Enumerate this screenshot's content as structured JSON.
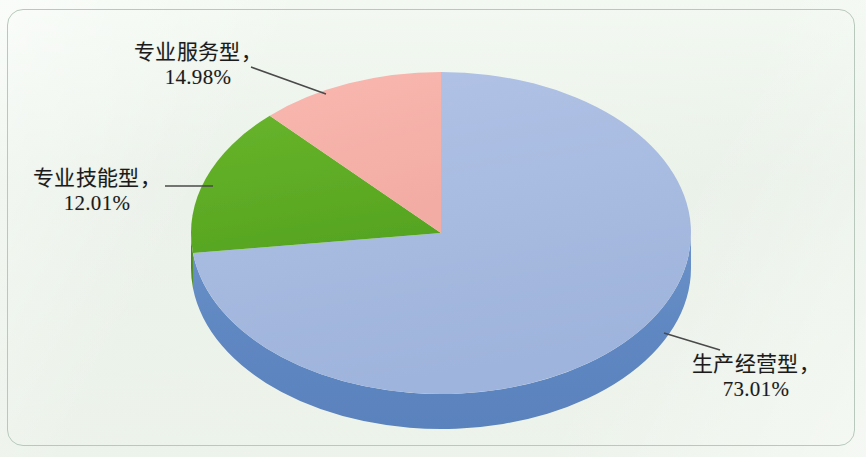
{
  "chart_data": {
    "type": "pie",
    "title": "",
    "subtitle": "",
    "xlabel": "",
    "ylabel": "",
    "three_d": true,
    "legend_position": "none",
    "label_style": "callout-with-leader-line",
    "grid": false,
    "categories": [
      "生产经营型",
      "专业服务型",
      "专业技能型"
    ],
    "values": [
      73.01,
      14.98,
      12.01
    ],
    "units": "%",
    "slices": [
      {
        "name": "生产经营型",
        "value": 73.01,
        "value_text": "73.01%",
        "label_text": "生产经营型，",
        "color": "#aabce1",
        "side_color": "#5f87c1",
        "start_angle_deg": 0,
        "sweep_deg": 262.836
      },
      {
        "name": "专业服务型",
        "value": 14.98,
        "value_text": "14.98%",
        "label_text": "专业服务型，",
        "color": "#5fae26",
        "side_color": "#4a8c1d",
        "start_angle_deg": 262.836,
        "sweep_deg": 53.928
      },
      {
        "name": "专业技能型",
        "value": 12.01,
        "value_text": "12.01%",
        "label_text": "专业技能型，",
        "color": "#f6b2aa",
        "side_color": "#d98a82",
        "start_angle_deg": 316.764,
        "sweep_deg": 43.236
      }
    ]
  },
  "canvas": {
    "background_color": "#eef3ec",
    "border_color": "#b8c9bc",
    "text_color": "#1b1b1b",
    "leader_line_color": "#4a4a4a"
  },
  "labels": {
    "green": {
      "name": "专业服务型，",
      "value": "14.98%"
    },
    "pink": {
      "name": "专业技能型，",
      "value": "12.01%"
    },
    "blue": {
      "name": "生产经营型，",
      "value": "73.01%"
    }
  }
}
